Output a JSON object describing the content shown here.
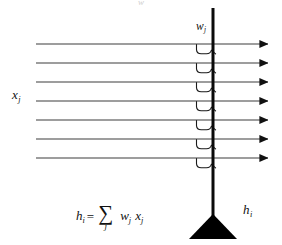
{
  "diagram": {
    "type": "neural-summation",
    "background_color": "#ffffff",
    "ink_color": "#111111",
    "line_color": "#444444",
    "labels": {
      "input_label": "x",
      "input_label_sub": "j",
      "weight_label": "w",
      "weight_label_sub": "j",
      "output_label": "h",
      "output_label_sub": "i"
    },
    "formula": {
      "lhs": "h",
      "lhs_sub": "i",
      "equals": "=",
      "sigma": "∑",
      "sigma_index": "j",
      "factor1": "w",
      "factor1_sub": "j",
      "factor2": "x",
      "factor2_sub": "j"
    },
    "geometry": {
      "dendrite_x": 213,
      "dendrite_top_y": 8,
      "dendrite_bottom_y": 216,
      "dendrite_width": 3,
      "line_start_x": 36,
      "arrow_tip_x": 274,
      "line_count": 7,
      "line_y_positions": [
        44,
        63,
        82,
        101,
        120,
        139,
        158
      ],
      "soma_triangle": {
        "cx": 213,
        "apex_y": 216,
        "base_y": 239,
        "half_width": 24
      }
    },
    "top_crumb": "w"
  }
}
